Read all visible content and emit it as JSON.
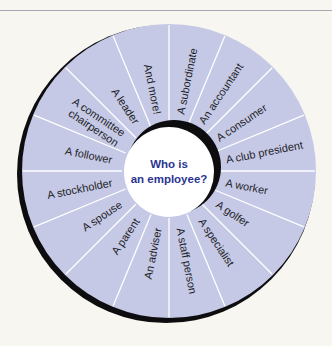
{
  "diagram": {
    "center_lines": [
      "Who is",
      "an employee?"
    ],
    "colors": {
      "background": "#f7f6f1",
      "ring_fill": "#c5c9e6",
      "divider": "#ffffff",
      "shadow": "#0d0d10",
      "label_text": "#1e1e26",
      "center_text": "#2b3592",
      "top_rule": "#a9a9b3"
    },
    "segments": [
      {
        "label_lines": [
          "A subordinate"
        ]
      },
      {
        "label_lines": [
          "An accountant"
        ]
      },
      {
        "label_lines": [
          "A consumer"
        ]
      },
      {
        "label_lines": [
          "A club president"
        ]
      },
      {
        "label_lines": [
          "A worker"
        ]
      },
      {
        "label_lines": [
          "A golfer"
        ]
      },
      {
        "label_lines": [
          "A specialist"
        ]
      },
      {
        "label_lines": [
          "A staff person"
        ]
      },
      {
        "label_lines": [
          "An adviser"
        ]
      },
      {
        "label_lines": [
          "A parent"
        ]
      },
      {
        "label_lines": [
          "A spouse"
        ]
      },
      {
        "label_lines": [
          "A stockholder"
        ]
      },
      {
        "label_lines": [
          "A follower"
        ]
      },
      {
        "label_lines": [
          "A committee",
          "chairperson"
        ]
      },
      {
        "label_lines": [
          "A leader"
        ]
      },
      {
        "label_lines": [
          "And more!"
        ]
      }
    ]
  }
}
